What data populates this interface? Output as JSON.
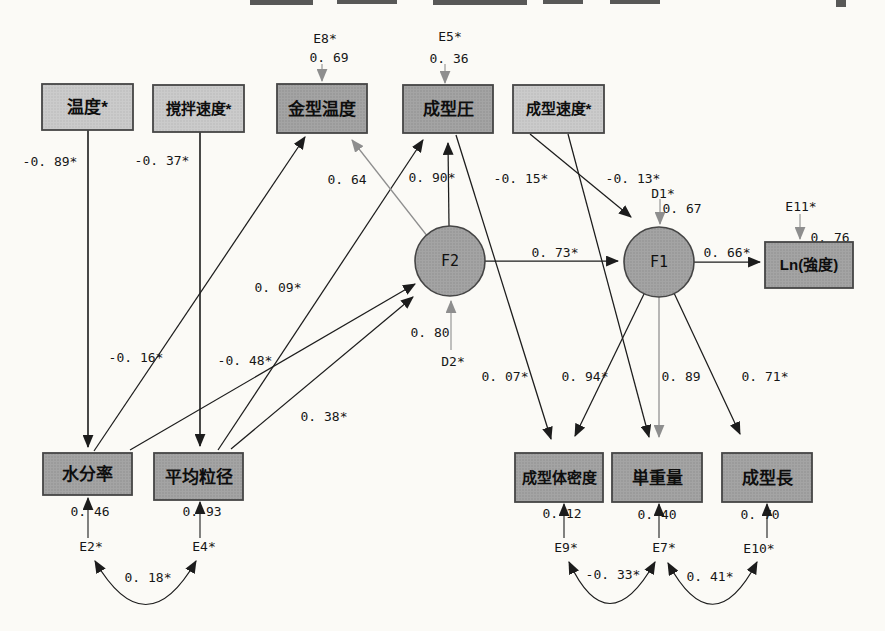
{
  "figure": {
    "kind": "sem-path-diagram",
    "background": "#fbfaf6",
    "palette": {
      "box_light": "#cbcbcb",
      "box_light_dot": "#b5b5b5",
      "box_dark": "#a4a4a4",
      "box_dark_dot": "#8b8b8b",
      "border": "#454545",
      "line_black": "#1c1c1c",
      "line_gray": "#8e8e8e",
      "text": "#161616"
    },
    "nodes": [
      {
        "id": "temperature",
        "label": "温度*",
        "shape": "rect",
        "variant": "light",
        "x": 42,
        "y": 84,
        "w": 91,
        "h": 46
      },
      {
        "id": "stirring-speed",
        "label": "撹拌速度*",
        "shape": "rect",
        "variant": "light",
        "x": 153,
        "y": 85,
        "w": 91,
        "h": 47
      },
      {
        "id": "mold-temperature",
        "label": "金型温度",
        "shape": "rect",
        "variant": "dark",
        "x": 277,
        "y": 84,
        "w": 90,
        "h": 49
      },
      {
        "id": "molding-pressure",
        "label": "成型圧",
        "shape": "rect",
        "variant": "dark",
        "x": 403,
        "y": 85,
        "w": 90,
        "h": 48
      },
      {
        "id": "molding-speed",
        "label": "成型速度*",
        "shape": "rect",
        "variant": "light",
        "x": 513,
        "y": 85,
        "w": 91,
        "h": 48
      },
      {
        "id": "ln-strength",
        "label": "Ln(強度)",
        "shape": "rect",
        "variant": "dark",
        "x": 765,
        "y": 242,
        "w": 88,
        "h": 46
      },
      {
        "id": "moisture-content",
        "label": "水分率",
        "shape": "rect",
        "variant": "dark",
        "x": 43,
        "y": 453,
        "w": 89,
        "h": 42
      },
      {
        "id": "mean-particle-size",
        "label": "平均粒径",
        "shape": "rect",
        "variant": "dark",
        "x": 154,
        "y": 453,
        "w": 89,
        "h": 47
      },
      {
        "id": "molded-density",
        "label": "成型体密度",
        "shape": "rect",
        "variant": "dark",
        "x": 515,
        "y": 453,
        "w": 88,
        "h": 49
      },
      {
        "id": "unit-weight",
        "label": "単重量",
        "shape": "rect",
        "variant": "dark",
        "x": 612,
        "y": 453,
        "w": 90,
        "h": 49
      },
      {
        "id": "molding-length",
        "label": "成型長",
        "shape": "rect",
        "variant": "dark",
        "x": 722,
        "y": 453,
        "w": 90,
        "h": 49
      },
      {
        "id": "factor-f2",
        "label": "F2",
        "shape": "circle",
        "variant": "dark",
        "cx": 450,
        "cy": 261,
        "r": 35
      },
      {
        "id": "factor-f1",
        "label": "F1",
        "shape": "circle",
        "variant": "dark",
        "cx": 659,
        "cy": 262,
        "r": 35
      }
    ],
    "paths": [
      {
        "name": "temperature-to-moisture",
        "from": [
          88,
          130
        ],
        "to": [
          88,
          447
        ],
        "color": "black",
        "w": 1.6,
        "label": "-0. 89*",
        "lx": 50,
        "ly": 166
      },
      {
        "name": "stirring-to-particle-size",
        "from": [
          200,
          132
        ],
        "to": [
          200,
          446
        ],
        "color": "black",
        "w": 1.6,
        "label": "-0. 37*",
        "lx": 162,
        "ly": 165
      },
      {
        "name": "moisture-to-mold-temperature",
        "from": [
          94,
          451
        ],
        "to": [
          305,
          137
        ],
        "color": "black",
        "w": 1.25,
        "label": "-0. 16*",
        "lx": 136,
        "ly": 362
      },
      {
        "name": "moisture-to-f2",
        "from": [
          130,
          450
        ],
        "to": [
          415,
          284
        ],
        "color": "black",
        "w": 1.25,
        "label": "-0. 48*",
        "lx": 245,
        "ly": 365
      },
      {
        "name": "particle-size-to-pressure",
        "from": [
          218,
          450
        ],
        "to": [
          423,
          140
        ],
        "color": "black",
        "w": 1.25,
        "label": "0. 09*",
        "lx": 278,
        "ly": 292
      },
      {
        "name": "particle-size-to-f2",
        "from": [
          231,
          449
        ],
        "to": [
          413,
          297
        ],
        "color": "black",
        "w": 1.25,
        "label": "0. 38*",
        "lx": 324,
        "ly": 421
      },
      {
        "name": "f2-to-mold-temperature",
        "from": [
          428,
          237
        ],
        "to": [
          352,
          140
        ],
        "color": "gray",
        "w": 1.25,
        "label": "0. 64",
        "lx": 347,
        "ly": 184
      },
      {
        "name": "f2-to-pressure",
        "from": [
          449,
          226
        ],
        "to": [
          448,
          143
        ],
        "color": "black",
        "w": 1.25,
        "label": "0. 90*",
        "lx": 432,
        "ly": 182
      },
      {
        "name": "f2-to-f1",
        "from": [
          485,
          261
        ],
        "to": [
          618,
          261
        ],
        "color": "black",
        "w": 1.25,
        "label": "0. 73*",
        "lx": 555,
        "ly": 257
      },
      {
        "name": "f1-to-ln-strength",
        "from": [
          694,
          262
        ],
        "to": [
          760,
          262
        ],
        "color": "black",
        "w": 1.25,
        "label": "0. 66*",
        "lx": 727,
        "ly": 257
      },
      {
        "name": "molding-speed-to-f1",
        "from": [
          530,
          134
        ],
        "to": [
          631,
          217
        ],
        "color": "black",
        "w": 1.25,
        "label": "-0. 13*",
        "lx": 633,
        "ly": 183
      },
      {
        "name": "molding-speed-to-unit-weight",
        "from": [
          568,
          134
        ],
        "to": [
          649,
          437
        ],
        "color": "black",
        "w": 1.25,
        "label": "-0. 15*",
        "lx": 521,
        "ly": 183
      },
      {
        "name": "pressure-to-molded-density",
        "from": [
          456,
          135
        ],
        "to": [
          551,
          439
        ],
        "color": "black",
        "w": 1.25,
        "label": "0. 07*",
        "lx": 505,
        "ly": 381
      },
      {
        "name": "f1-to-molded-density",
        "from": [
          644,
          294
        ],
        "to": [
          575,
          436
        ],
        "color": "black",
        "w": 1.25,
        "label": "0. 94*",
        "lx": 585,
        "ly": 381
      },
      {
        "name": "f1-to-unit-weight",
        "from": [
          659,
          297
        ],
        "to": [
          659,
          437
        ],
        "color": "gray",
        "w": 1.25,
        "label": "0. 89",
        "lx": 681,
        "ly": 381
      },
      {
        "name": "f1-to-molding-length",
        "from": [
          674,
          293
        ],
        "to": [
          740,
          434
        ],
        "color": "black",
        "w": 1.25,
        "label": "0. 71*",
        "lx": 765,
        "ly": 381
      }
    ],
    "disturbances": [
      {
        "name": "e8",
        "var_label": "E8*",
        "value": "0. 69",
        "color": "gray",
        "from": [
          322,
          64
        ],
        "to": [
          322,
          81
        ],
        "var_pos": [
          325,
          43
        ],
        "val_pos": [
          329,
          62
        ]
      },
      {
        "name": "e5",
        "var_label": "E5*",
        "value": "0. 36",
        "color": "gray",
        "from": [
          445,
          64
        ],
        "to": [
          445,
          83
        ],
        "var_pos": [
          450,
          41
        ],
        "val_pos": [
          449,
          63
        ]
      },
      {
        "name": "d1",
        "var_label": "D1*",
        "value": "0. 67",
        "color": "gray",
        "from": [
          660,
          199
        ],
        "to": [
          660,
          224
        ],
        "var_pos": [
          663,
          198
        ],
        "val_pos": [
          682,
          213
        ]
      },
      {
        "name": "e11",
        "var_label": "E11*",
        "value": "0. 76",
        "color": "gray",
        "from": [
          800,
          214
        ],
        "to": [
          800,
          239
        ],
        "var_pos": [
          801,
          211
        ],
        "val_pos": [
          830,
          242
        ]
      },
      {
        "name": "d2",
        "var_label": "D2*",
        "value": "0. 80",
        "color": "gray",
        "from": [
          451,
          350
        ],
        "to": [
          451,
          301
        ],
        "var_pos": [
          453,
          366
        ],
        "val_pos": [
          430,
          337
        ]
      },
      {
        "name": "e2",
        "var_label": "E2*",
        "value": "0. 46",
        "color": "black",
        "from": [
          88,
          538
        ],
        "to": [
          88,
          498
        ],
        "var_pos": [
          91,
          551
        ],
        "val_pos": [
          90,
          516
        ]
      },
      {
        "name": "e4",
        "var_label": "E4*",
        "value": "0. 93",
        "color": "black",
        "from": [
          200,
          538
        ],
        "to": [
          200,
          502
        ],
        "var_pos": [
          204,
          551
        ],
        "val_pos": [
          202,
          516
        ]
      },
      {
        "name": "e9",
        "var_label": "E9*",
        "value": "0. 12",
        "color": "black",
        "from": [
          564,
          538
        ],
        "to": [
          564,
          504
        ],
        "var_pos": [
          566,
          552
        ],
        "val_pos": [
          562,
          518
        ]
      },
      {
        "name": "e7",
        "var_label": "E7*",
        "value": "0. 40",
        "color": "black",
        "from": [
          659,
          538
        ],
        "to": [
          659,
          504
        ],
        "var_pos": [
          664,
          552
        ],
        "val_pos": [
          657,
          519
        ]
      },
      {
        "name": "e10",
        "var_label": "E10*",
        "value": "0. 70",
        "color": "black",
        "from": [
          767,
          538
        ],
        "to": [
          767,
          504
        ],
        "var_pos": [
          759,
          553
        ],
        "val_pos": [
          760,
          519
        ]
      }
    ],
    "covariances": [
      {
        "name": "e2-e4",
        "label": "0. 18*",
        "from": [
          95,
          561
        ],
        "to": [
          196,
          561
        ],
        "ctrl": [
          146,
          648
        ],
        "lx": 148,
        "ly": 582
      },
      {
        "name": "e9-e7",
        "label": "-0. 33*",
        "from": [
          569,
          562
        ],
        "to": [
          655,
          562
        ],
        "ctrl": [
          608,
          645
        ],
        "lx": 613,
        "ly": 579
      },
      {
        "name": "e7-e10",
        "label": "0. 41*",
        "from": [
          668,
          563
        ],
        "to": [
          757,
          562
        ],
        "ctrl": [
          713,
          646
        ],
        "lx": 710,
        "ly": 581
      }
    ],
    "artifacts": [
      [
        250,
        0,
        63,
        5
      ],
      [
        337,
        0,
        60,
        4
      ],
      [
        433,
        0,
        94,
        5
      ],
      [
        543,
        0,
        40,
        4
      ],
      [
        610,
        0,
        50,
        4
      ],
      [
        836,
        0,
        10,
        7
      ]
    ]
  }
}
